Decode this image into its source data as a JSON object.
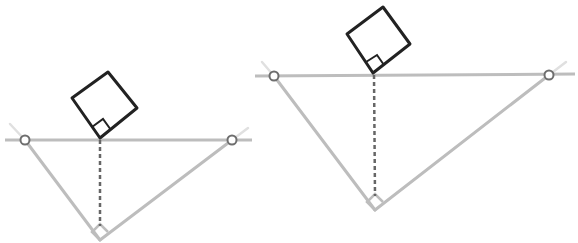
{
  "diagram": {
    "colors": {
      "background": "#ffffff",
      "triangle_stroke": "#bdbdbd",
      "extension_stroke": "#e0e0e0",
      "square_stroke": "#222222",
      "altitude_stroke": "#666666",
      "endpoint_stroke": "#6e6e6e",
      "right_angle_marker_small": "#bdbdbd"
    },
    "figures": [
      {
        "id": "left",
        "hypotenuse": {
          "x1": 5,
          "y1": 140,
          "x2": 252,
          "y2": 140
        },
        "endpoints": [
          {
            "x": 25,
            "y": 140
          },
          {
            "x": 232,
            "y": 140
          }
        ],
        "right_vertex": {
          "x": 100,
          "y": 240
        },
        "altitude_foot": {
          "x": 100,
          "y": 140
        },
        "square": [
          [
            100,
            138
          ],
          [
            72,
            98
          ],
          [
            108,
            72
          ],
          [
            137,
            108
          ]
        ],
        "square_marker": [
          [
            100,
            138
          ],
          [
            92,
            127
          ],
          [
            103,
            119
          ],
          [
            111,
            130
          ]
        ],
        "vertex_marker": [
          [
            100,
            240
          ],
          [
            92,
            232
          ],
          [
            100,
            224
          ],
          [
            108,
            232
          ]
        ],
        "extensions": [
          {
            "x1": 10,
            "y1": 124,
            "x2": 25,
            "y2": 140
          },
          {
            "x1": 232,
            "y1": 140,
            "x2": 248,
            "y2": 128
          }
        ]
      },
      {
        "id": "right",
        "hypotenuse": {
          "x1": 255,
          "y1": 76,
          "x2": 575,
          "y2": 74
        },
        "endpoints": [
          {
            "x": 274,
            "y": 76
          },
          {
            "x": 549,
            "y": 75
          }
        ],
        "right_vertex": {
          "x": 375,
          "y": 210
        },
        "altitude_foot": {
          "x": 374,
          "y": 75
        },
        "square": [
          [
            373,
            73
          ],
          [
            347,
            34
          ],
          [
            383,
            7
          ],
          [
            410,
            44
          ]
        ],
        "square_marker": [
          [
            373,
            73
          ],
          [
            366,
            62
          ],
          [
            377,
            55
          ],
          [
            384,
            65
          ]
        ],
        "vertex_marker": [
          [
            375,
            210
          ],
          [
            367,
            202
          ],
          [
            375,
            194
          ],
          [
            383,
            202
          ]
        ],
        "extensions": [
          {
            "x1": 262,
            "y1": 62,
            "x2": 274,
            "y2": 76
          },
          {
            "x1": 549,
            "y1": 75,
            "x2": 566,
            "y2": 62
          }
        ]
      }
    ]
  }
}
